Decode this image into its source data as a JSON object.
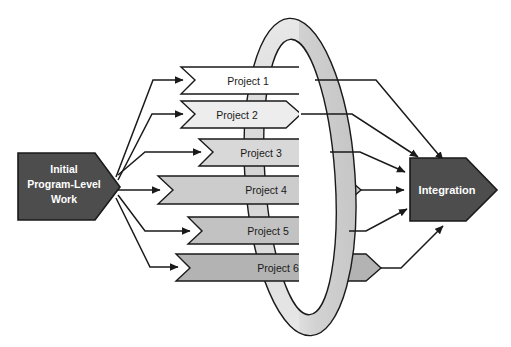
{
  "diagram": {
    "background": "#ffffff",
    "source": {
      "label_lines": [
        "Initial",
        "Program-Level",
        "Work"
      ],
      "text_color": "#ffffff",
      "fill": "#4d4d4d",
      "stroke": "#1a1a1a",
      "shape": "right-chevron-arrow"
    },
    "target": {
      "label": "Integration",
      "text_color": "#ffffff",
      "fill": "#4d4d4d",
      "stroke": "#1a1a1a",
      "shape": "right-chevron-arrow"
    },
    "ring": {
      "name": "integration-loop-ring",
      "fill": "#d9d9d9",
      "highlight": "#f2f2f2",
      "stroke": "#1a1a1a",
      "shape": "tilted-torus-ellipse"
    },
    "projects": [
      {
        "label": "Project 1",
        "fill": "#ffffff",
        "stroke": "#1a1a1a",
        "text_color": "#1a1a1a"
      },
      {
        "label": "Project 2",
        "fill": "#ededed",
        "stroke": "#1a1a1a",
        "text_color": "#1a1a1a"
      },
      {
        "label": "Project 3",
        "fill": "#d8d8d8",
        "stroke": "#1a1a1a",
        "text_color": "#1a1a1a"
      },
      {
        "label": "Project 4",
        "fill": "#cccccc",
        "stroke": "#1a1a1a",
        "text_color": "#1a1a1a"
      },
      {
        "label": "Project 5",
        "fill": "#c2c2c2",
        "stroke": "#1a1a1a",
        "text_color": "#1a1a1a"
      },
      {
        "label": "Project 6",
        "fill": "#b3b3b3",
        "stroke": "#1a1a1a",
        "text_color": "#1a1a1a"
      }
    ],
    "connectors": {
      "stroke": "#1a1a1a",
      "inbound_count": 6,
      "outbound_count": 6
    }
  }
}
